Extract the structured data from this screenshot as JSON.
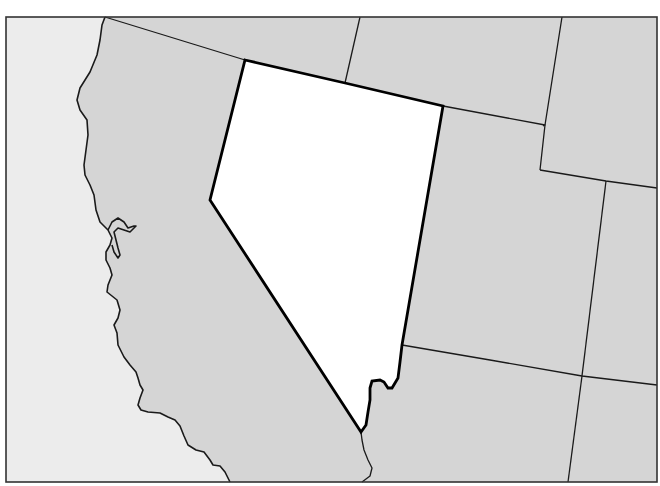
{
  "map": {
    "type": "outline-map",
    "region": "Western United States",
    "highlighted_state": "Nevada",
    "visible_states": [
      "Oregon",
      "California",
      "Nevada",
      "Idaho",
      "Utah",
      "Wyoming",
      "Arizona",
      "Colorado",
      "New Mexico"
    ],
    "colors": {
      "ocean": "#ececec",
      "land": "#d5d5d5",
      "highlight": "#ffffff",
      "border": "#1a1a1a"
    },
    "labels": []
  }
}
